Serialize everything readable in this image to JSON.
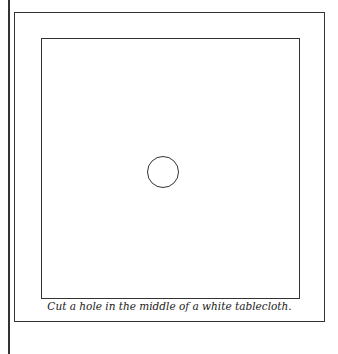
{
  "figure": {
    "caption": "Cut a hole in the middle of a white tablecloth.",
    "elements": [
      "page-margin-line",
      "outer-frame",
      "tablecloth-square",
      "hole-circle"
    ],
    "line_color": "#333333"
  }
}
